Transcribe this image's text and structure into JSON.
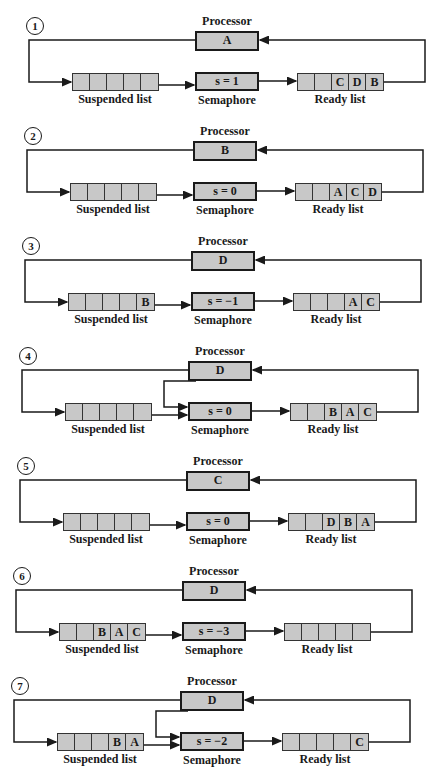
{
  "labels": {
    "processor": "Processor",
    "semaphore": "Semaphore",
    "suspended": "Suspended list",
    "ready": "Ready list"
  },
  "colors": {
    "box_fill": "#c8c8c8",
    "stroke": "#1a1a1a",
    "background": "#ffffff"
  },
  "panels": [
    {
      "step": "1",
      "processor": "A",
      "semaphore": "s = 1",
      "suspended": [
        "",
        "",
        "",
        "",
        ""
      ],
      "ready": [
        "",
        "",
        "C",
        "D",
        "B"
      ],
      "proc_to_sem": false
    },
    {
      "step": "2",
      "processor": "B",
      "semaphore": "s = 0",
      "suspended": [
        "",
        "",
        "",
        "",
        ""
      ],
      "ready": [
        "",
        "",
        "A",
        "C",
        "D"
      ],
      "proc_to_sem": false
    },
    {
      "step": "3",
      "processor": "D",
      "semaphore": "s = −1",
      "suspended": [
        "",
        "",
        "",
        "",
        "B"
      ],
      "ready": [
        "",
        "",
        "",
        "A",
        "C"
      ],
      "proc_to_sem": false
    },
    {
      "step": "4",
      "processor": "D",
      "semaphore": "s = 0",
      "suspended": [
        "",
        "",
        "",
        "",
        ""
      ],
      "ready": [
        "",
        "",
        "B",
        "A",
        "C"
      ],
      "proc_to_sem": true
    },
    {
      "step": "5",
      "processor": "C",
      "semaphore": "s = 0",
      "suspended": [
        "",
        "",
        "",
        "",
        ""
      ],
      "ready": [
        "",
        "",
        "D",
        "B",
        "A"
      ],
      "proc_to_sem": false
    },
    {
      "step": "6",
      "processor": "D",
      "semaphore": "s = −3",
      "suspended": [
        "",
        "",
        "B",
        "A",
        "C"
      ],
      "ready": [
        "",
        "",
        "",
        "",
        ""
      ],
      "proc_to_sem": false
    },
    {
      "step": "7",
      "processor": "D",
      "semaphore": "s = −2",
      "suspended": [
        "",
        "",
        "",
        "B",
        "A"
      ],
      "ready": [
        "",
        "",
        "",
        "",
        "C"
      ],
      "proc_to_sem": true
    }
  ]
}
